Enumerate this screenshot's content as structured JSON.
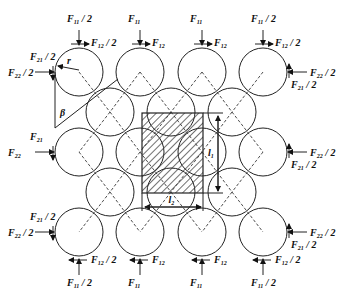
{
  "diagram": {
    "type": "particle packing force diagram",
    "colors": {
      "stroke": "#222222",
      "background": "#ffffff",
      "hatch": "#333333"
    },
    "circle_radius": 24,
    "rows": [
      {
        "y": 72,
        "xs": [
          79,
          140,
          202,
          263
        ]
      },
      {
        "y": 112,
        "xs": [
          110,
          171,
          232
        ]
      },
      {
        "y": 152,
        "xs": [
          79,
          140,
          202,
          263
        ]
      },
      {
        "y": 192,
        "xs": [
          110,
          171,
          232
        ]
      },
      {
        "y": 232,
        "xs": [
          79,
          140,
          202,
          263
        ]
      }
    ],
    "cell": {
      "x": 142,
      "y": 113,
      "w": 61,
      "h": 80,
      "label_height": "l",
      "label_height_sub": "1",
      "label_width": "l",
      "label_width_sub": "2"
    },
    "top_labels": [
      {
        "main": "F",
        "sub": "11",
        "suffix": "/ 2",
        "shear": "F",
        "shear_sub": "12",
        "shear_suffix": "/ 2"
      },
      {
        "main": "F",
        "sub": "11",
        "suffix": "",
        "shear": "F",
        "shear_sub": "12",
        "shear_suffix": ""
      },
      {
        "main": "F",
        "sub": "11",
        "suffix": "",
        "shear": "F",
        "shear_sub": "12",
        "shear_suffix": ""
      },
      {
        "main": "F",
        "sub": "11",
        "suffix": "/ 2",
        "shear": "F",
        "shear_sub": "12",
        "shear_suffix": "/ 2"
      }
    ],
    "left_labels": [
      {
        "a": "F",
        "a_sub": "21",
        "a_suffix": "/ 2",
        "b": "F",
        "b_sub": "22",
        "b_suffix": "/ 2"
      },
      {
        "a": "F",
        "a_sub": "21",
        "a_suffix": "",
        "b": "F",
        "b_sub": "22",
        "b_suffix": ""
      },
      {
        "a": "F",
        "a_sub": "21",
        "a_suffix": "/ 2",
        "b": "F",
        "b_sub": "22",
        "b_suffix": "/ 2"
      }
    ],
    "right_labels": [
      {
        "a": "F",
        "a_sub": "22",
        "a_suffix": "/ 2",
        "b": "F",
        "b_sub": "21",
        "b_suffix": "/ 2"
      },
      {
        "a": "F",
        "a_sub": "22",
        "a_suffix": "/ 2",
        "b": "F",
        "b_sub": "21",
        "b_suffix": "/ 2"
      },
      {
        "a": "F",
        "a_sub": "22",
        "a_suffix": "/ 2",
        "b": "F",
        "b_sub": "21",
        "b_suffix": "/ 2"
      }
    ],
    "symbols": {
      "radius": "r",
      "angle": "β"
    }
  }
}
